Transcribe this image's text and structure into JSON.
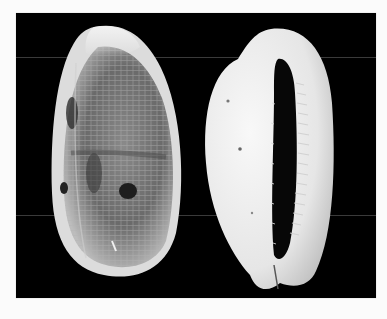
{
  "image": {
    "description": "Two cowrie shells photographed on a black background: dorsal view (left) and ventral/apertural view (right)",
    "background_color": "#000000",
    "border_color": "#fbfbfb",
    "subjects": [
      {
        "name": "cowrie-shell-dorsal-view",
        "position": "left",
        "features": [
          "mottled brown-gray reticulated pattern",
          "pale whitish apex",
          "dark blotches"
        ]
      },
      {
        "name": "cowrie-shell-ventral-view",
        "position": "right",
        "features": [
          "smooth white base",
          "long narrow toothed aperture"
        ]
      }
    ]
  }
}
